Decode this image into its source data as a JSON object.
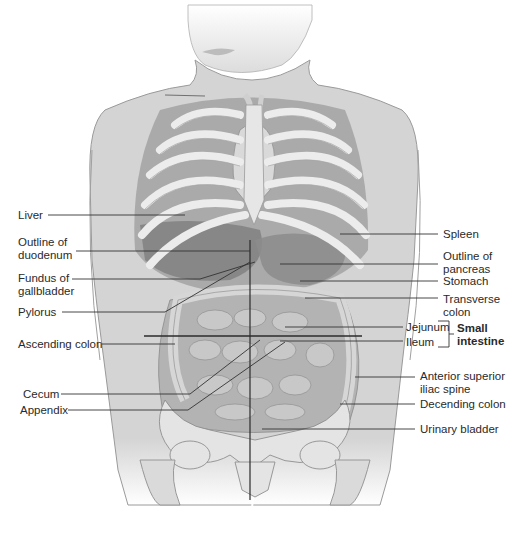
{
  "figure": {
    "colors": {
      "background": "#ffffff",
      "skin": "#d9d9d9",
      "skin_shade": "#bdbdbd",
      "rib": "#e8e8e8",
      "organ_dark": "#8a8a8a",
      "organ_mid": "#a8a8a8",
      "intestine": "#b8b8b8",
      "leader_line": "#333333",
      "text": "#2a2a2a"
    },
    "left_labels": [
      {
        "id": "liver",
        "text": "Liver",
        "x": 18,
        "y": 209,
        "line_y": 215,
        "line_x1": 48,
        "line_x2": 185
      },
      {
        "id": "duodenum",
        "text": "Outline of\nduodenum",
        "x": 18,
        "y": 236,
        "line_y": 251,
        "line_x1": 76,
        "line_x2": 250
      },
      {
        "id": "gallbladder",
        "text": "Fundus of\ngallbladder",
        "x": 18,
        "y": 272,
        "line_y": 279,
        "line_x1": 72,
        "line_x2": 200
      },
      {
        "id": "pylorus",
        "text": "Pylorus",
        "x": 18,
        "y": 306,
        "line_y": 312,
        "line_x1": 62,
        "line_x2": 165
      },
      {
        "id": "ascending-colon",
        "text": "Ascending colon",
        "x": 18,
        "y": 338,
        "line_y": 344,
        "line_x1": 102,
        "line_x2": 175
      },
      {
        "id": "cecum",
        "text": "Cecum",
        "x": 23,
        "y": 388,
        "line_y": 394,
        "line_x1": 61,
        "line_x2": 190
      },
      {
        "id": "appendix",
        "text": "Appendix",
        "x": 20,
        "y": 404,
        "line_y": 410,
        "line_x1": 68,
        "line_x2": 188
      }
    ],
    "right_labels": [
      {
        "id": "spleen",
        "text": "Spleen",
        "x": 443,
        "y": 228,
        "line_y": 234,
        "line_x1": 340,
        "line_x2": 438
      },
      {
        "id": "pancreas",
        "text": "Outline of\npancreas",
        "x": 443,
        "y": 250,
        "line_y": 264,
        "line_x1": 280,
        "line_x2": 438
      },
      {
        "id": "stomach",
        "text": "Stomach",
        "x": 443,
        "y": 275,
        "line_y": 281,
        "line_x1": 300,
        "line_x2": 438
      },
      {
        "id": "transverse-colon",
        "text": "Transverse\ncolon",
        "x": 443,
        "y": 293,
        "line_y": 298,
        "line_x1": 305,
        "line_x2": 438
      },
      {
        "id": "jejunum",
        "text": "Jejunum",
        "x": 408,
        "y": 321,
        "line_y": 327,
        "line_x1": 285,
        "line_x2": 403
      },
      {
        "id": "ileum",
        "text": "Ileum",
        "x": 408,
        "y": 336,
        "line_y": 341,
        "line_x1": 280,
        "line_x2": 403
      },
      {
        "id": "asis",
        "text": "Anterior superior\niliac spine",
        "x": 420,
        "y": 370,
        "line_y": 377,
        "line_x1": 355,
        "line_x2": 415
      },
      {
        "id": "descending-colon",
        "text": "Decending colon",
        "x": 420,
        "y": 398,
        "line_y": 404,
        "line_x1": 340,
        "line_x2": 415
      },
      {
        "id": "urinary-bladder",
        "text": "Urinary bladder",
        "x": 420,
        "y": 423,
        "line_y": 429,
        "line_x1": 262,
        "line_x2": 415
      }
    ],
    "group_label": {
      "id": "small-intestine",
      "text": "Small\nintestine",
      "x": 457,
      "y": 322
    }
  }
}
